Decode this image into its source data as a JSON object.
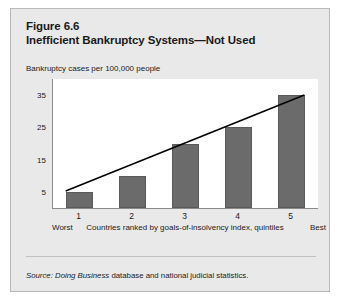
{
  "figure": {
    "number": "Figure 6.6",
    "title": "Inefficient Bankruptcy Systems—Not Used",
    "subtitle": "Bankruptcy cases per 100,000 people",
    "source_label": "Source:",
    "source_italic": "Doing Business",
    "source_rest": " database and national judicial statistics.",
    "colors": {
      "panel_background": "#e9e9e9",
      "plot_background": "#ffffff",
      "bar_fill": "#6b6b6b",
      "bar_stroke": "#5a5a5a",
      "axis": "#8a8a8a",
      "trendline": "#000000",
      "text": "#1a1a1a"
    }
  },
  "chart_data": {
    "type": "bar",
    "title": "Inefficient Bankruptcy Systems—Not Used",
    "subtitle": "Bankruptcy cases per 100,000 people",
    "categories": [
      "1",
      "2",
      "3",
      "4",
      "5"
    ],
    "values": [
      5,
      10,
      20,
      25,
      35
    ],
    "xlabel": "Countries ranked by goals-of-insolvency index, quintiles",
    "ylabel": "Bankruptcy cases per 100,000 people",
    "ylim": [
      0,
      40
    ],
    "yticks": [
      5,
      15,
      25,
      35
    ],
    "ytick_labels": [
      "5",
      "15",
      "25",
      "35"
    ],
    "xtick_labels": [
      "1",
      "2",
      "3",
      "4",
      "5"
    ],
    "x_axis_start_label": "Worst",
    "x_axis_end_label": "Best",
    "grid": false,
    "legend": false,
    "annotations": [
      {
        "type": "trendline",
        "from": {
          "category": "1",
          "value": 5
        },
        "to": {
          "category": "5",
          "value": 35
        },
        "style": "solid-black"
      }
    ]
  }
}
